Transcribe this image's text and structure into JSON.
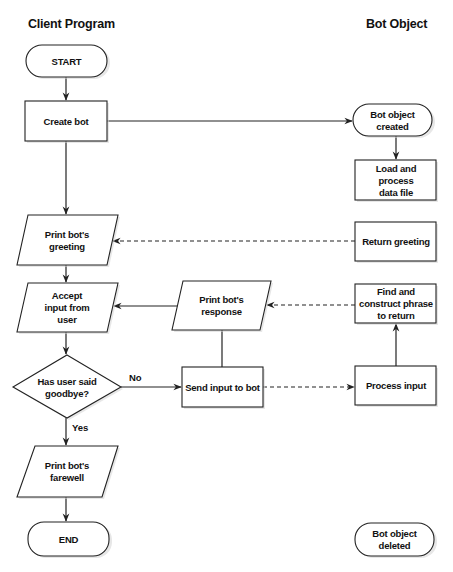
{
  "lanes": {
    "client": "Client Program",
    "bot": "Bot Object"
  },
  "nodes": {
    "start": {
      "type": "terminator",
      "lines": [
        "START"
      ]
    },
    "create_bot": {
      "type": "process",
      "lines": [
        "Create bot"
      ]
    },
    "bot_created": {
      "type": "terminator",
      "lines": [
        "Bot object",
        "created"
      ]
    },
    "load_data": {
      "type": "process",
      "lines": [
        "Load and",
        "process",
        "data file"
      ]
    },
    "print_greeting": {
      "type": "io",
      "lines": [
        "Print bot's",
        "greeting"
      ]
    },
    "return_greeting": {
      "type": "process",
      "lines": [
        "Return greeting"
      ]
    },
    "accept_input": {
      "type": "io",
      "lines": [
        "Accept",
        "input from",
        "user"
      ]
    },
    "print_response": {
      "type": "io",
      "lines": [
        "Print bot's",
        "response"
      ]
    },
    "find_phrase": {
      "type": "process",
      "lines": [
        "Find and",
        "construct phrase",
        "to return"
      ]
    },
    "goodbye_check": {
      "type": "decision",
      "lines": [
        "Has user said",
        "goodbye?"
      ]
    },
    "send_input": {
      "type": "process",
      "lines": [
        "Send input to bot"
      ]
    },
    "process_input": {
      "type": "process",
      "lines": [
        "Process input"
      ]
    },
    "print_farewell": {
      "type": "io",
      "lines": [
        "Print bot's",
        "farewell"
      ]
    },
    "end": {
      "type": "terminator",
      "lines": [
        "END"
      ]
    },
    "bot_deleted": {
      "type": "terminator",
      "lines": [
        "Bot object",
        "deleted"
      ]
    }
  },
  "edges": [
    {
      "from": "start",
      "to": "create_bot",
      "style": "solid"
    },
    {
      "from": "create_bot",
      "to": "bot_created",
      "style": "solid"
    },
    {
      "from": "bot_created",
      "to": "load_data",
      "style": "solid"
    },
    {
      "from": "create_bot",
      "to": "print_greeting",
      "style": "solid"
    },
    {
      "from": "return_greeting",
      "to": "print_greeting",
      "style": "dashed"
    },
    {
      "from": "print_greeting",
      "to": "accept_input",
      "style": "solid"
    },
    {
      "from": "print_response",
      "to": "accept_input",
      "style": "solid"
    },
    {
      "from": "find_phrase",
      "to": "print_response",
      "style": "dashed"
    },
    {
      "from": "accept_input",
      "to": "goodbye_check",
      "style": "solid"
    },
    {
      "from": "goodbye_check",
      "to": "send_input",
      "style": "solid",
      "label": "No"
    },
    {
      "from": "send_input",
      "to": "print_response",
      "style": "solid"
    },
    {
      "from": "send_input",
      "to": "process_input",
      "style": "dashed"
    },
    {
      "from": "process_input",
      "to": "find_phrase",
      "style": "solid"
    },
    {
      "from": "goodbye_check",
      "to": "print_farewell",
      "style": "solid",
      "label": "Yes"
    },
    {
      "from": "print_farewell",
      "to": "end",
      "style": "solid"
    }
  ]
}
